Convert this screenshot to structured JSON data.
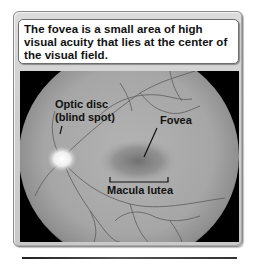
{
  "caption": {
    "text": "The fovea is a small area of high visual acuity that lies at the center of the visual field."
  },
  "figure": {
    "labels": {
      "optic_disc_line1": "Optic disc",
      "optic_disc_line2": "(blind spot)",
      "fovea": "Fovea",
      "macula": "Macula lutea"
    },
    "colors": {
      "background": "#000000",
      "retina": "#a9a9a9",
      "optic_disc": "#f4f4f4",
      "fovea_shadow": "#6f6f6f",
      "vessels": "#5e5e5e",
      "label_text": "#111111"
    }
  }
}
